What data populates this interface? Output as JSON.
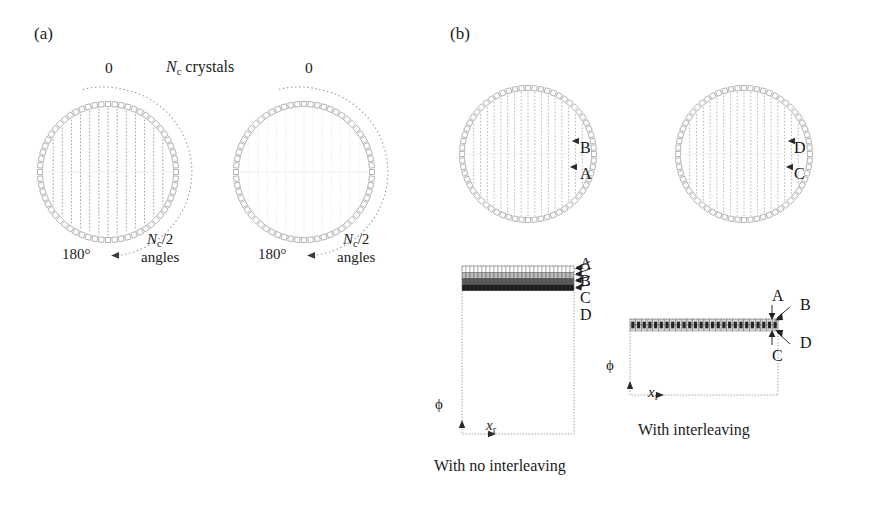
{
  "figure": {
    "panels": [
      {
        "id": "a",
        "label": "(a)"
      },
      {
        "id": "b",
        "label": "(b)"
      }
    ]
  },
  "panel_a": {
    "label": "(a)",
    "header": {
      "zero_left": "0",
      "crystals_text": "N",
      "crystals_sub": "c",
      "crystals_word": " crystals",
      "zero_right": "0"
    },
    "diagrams": [
      {
        "name": "ring-angle-0",
        "angle_label_deg": "180°",
        "angle_label_main": "N",
        "angle_label_sub": "c",
        "angle_label_tail": "/2",
        "angle_label_word": "angles",
        "zero_label": "0",
        "n_crystals": 64,
        "lor_count": 13,
        "lor_shade": "dark"
      },
      {
        "name": "ring-angle-1",
        "angle_label_deg": "180°",
        "angle_label_main": "N",
        "angle_label_sub": "c",
        "angle_label_tail": "/2",
        "angle_label_word": "angles",
        "zero_label": "0",
        "n_crystals": 64,
        "lor_count": 13,
        "lor_shade": "light"
      }
    ]
  },
  "panel_b": {
    "label": "(b)",
    "rings": [
      {
        "name": "ring-no-interleave",
        "n_crystals": 64,
        "lor_count": 17,
        "markers": [
          {
            "label": "B",
            "note": "upper marker arrow"
          },
          {
            "label": "A",
            "note": "lower marker arrow"
          }
        ]
      },
      {
        "name": "ring-interleave",
        "n_crystals": 64,
        "lor_count": 17,
        "markers": [
          {
            "label": "D",
            "note": "upper marker arrow"
          },
          {
            "label": "C",
            "note": "lower marker arrow"
          }
        ]
      }
    ],
    "sinograms": [
      {
        "name": "sinogram-no-interleaving",
        "caption": "With no interleaving",
        "axis_y": "ϕ",
        "axis_x_main": "x",
        "axis_x_sub": "r",
        "markers": [
          "A",
          "B",
          "C",
          "D"
        ],
        "bins_x": 28,
        "rows": 4,
        "row_shades": [
          "#ffffff",
          "#b8b8b8",
          "#5a5a5a",
          "#1a1a1a"
        ]
      },
      {
        "name": "sinogram-with-interleaving",
        "caption": "With interleaving",
        "axis_y": "ϕ",
        "axis_x_main": "x",
        "axis_x_sub": "r",
        "markers": [
          "A",
          "B",
          "C",
          "D"
        ],
        "bins_x": 26,
        "rows": 2,
        "row_shades": [
          "#d8d8d8",
          "#262626"
        ]
      }
    ]
  },
  "colors": {
    "ink": "#1a1a1a",
    "ring_crystal": "#9a9a9a",
    "lor_dark": "#8d8d8d",
    "lor_light": "#cfcfcf",
    "axis": "#8a8a8a",
    "arc": "#9d9d9d"
  }
}
